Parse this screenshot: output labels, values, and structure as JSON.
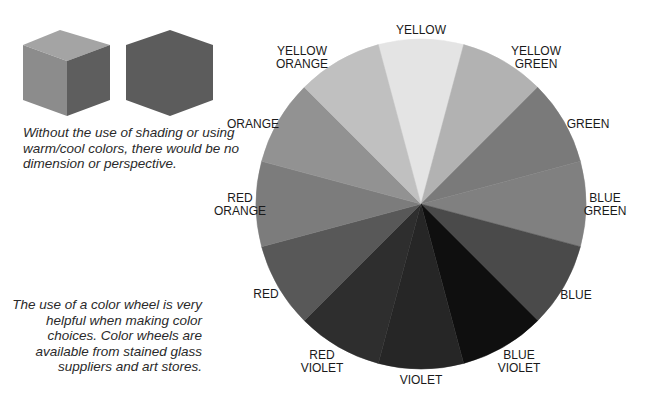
{
  "cubes": {
    "shaded": {
      "top": "#a4a4a4",
      "left": "#8c8c8c",
      "right": "#5e5e5e"
    },
    "flat": {
      "fill": "#5c5c5c"
    }
  },
  "captions": {
    "shading": "Without the use of shading or using warm/cool colors, there would be no dimension or perspective.",
    "wheel": "The use of a color wheel is very helpful when making color choices. Color wheels are available from stained glass suppliers and art stores."
  },
  "wheel": {
    "segments": [
      {
        "name": "YELLOW",
        "line1": "YELLOW",
        "line2": "",
        "fill": "#e4e4e4",
        "lx": 421,
        "ly": 30
      },
      {
        "name": "YELLOW GREEN",
        "line1": "YELLOW",
        "line2": "GREEN",
        "fill": "#b2b2b2",
        "lx": 536,
        "ly": 58
      },
      {
        "name": "GREEN",
        "line1": "GREEN",
        "line2": "",
        "fill": "#7a7a7a",
        "lx": 588,
        "ly": 124
      },
      {
        "name": "BLUE GREEN",
        "line1": "BLUE",
        "line2": "GREEN",
        "fill": "#808080",
        "lx": 605,
        "ly": 205
      },
      {
        "name": "BLUE",
        "line1": "BLUE",
        "line2": "",
        "fill": "#4a4a4a",
        "lx": 576,
        "ly": 295
      },
      {
        "name": "BLUE VIOLET",
        "line1": "BLUE",
        "line2": "VIOLET",
        "fill": "#0f0f0f",
        "lx": 519,
        "ly": 362
      },
      {
        "name": "VIOLET",
        "line1": "VIOLET",
        "line2": "",
        "fill": "#262626",
        "lx": 421,
        "ly": 380
      },
      {
        "name": "RED VIOLET",
        "line1": "RED",
        "line2": "VIOLET",
        "fill": "#2e2e2e",
        "lx": 322,
        "ly": 362
      },
      {
        "name": "RED",
        "line1": "RED",
        "line2": "",
        "fill": "#585858",
        "lx": 266,
        "ly": 294
      },
      {
        "name": "RED ORANGE",
        "line1": "RED",
        "line2": "ORANGE",
        "fill": "#7c7c7c",
        "lx": 240,
        "ly": 205
      },
      {
        "name": "ORANGE",
        "line1": "ORANGE",
        "line2": "",
        "fill": "#929292",
        "lx": 253,
        "ly": 124
      },
      {
        "name": "YELLOW ORANGE",
        "line1": "YELLOW",
        "line2": "ORANGE",
        "fill": "#c0c0c0",
        "lx": 302,
        "ly": 58
      }
    ]
  }
}
